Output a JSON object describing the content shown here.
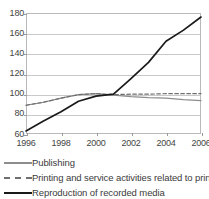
{
  "chart_data": {
    "type": "line",
    "title": "",
    "xlabel": "",
    "ylabel": "",
    "xlim": [
      1996,
      2006
    ],
    "ylim": [
      60,
      180
    ],
    "grid": true,
    "legend_position": "bottom-left",
    "ytick_labels": [
      "180",
      "160",
      "140",
      "120",
      "100",
      "80",
      "60"
    ],
    "yticks": [
      180,
      160,
      140,
      120,
      100,
      80,
      60
    ],
    "xtick_labels": [
      "1996",
      "1998",
      "2000",
      "2002",
      "2004",
      "2006"
    ],
    "xticks": [
      1996,
      1998,
      2000,
      2002,
      2004,
      2006
    ],
    "x": [
      1996,
      1997,
      1998,
      1999,
      2000,
      2001,
      2002,
      2003,
      2004,
      2005,
      2006
    ],
    "series": [
      {
        "name": "Publishing",
        "style": "solid",
        "color": "#8d8d8d",
        "values": [
          88.5,
          91.5,
          95.5,
          99.0,
          100.0,
          98.5,
          97.0,
          96.0,
          95.5,
          94.0,
          93.0
        ]
      },
      {
        "name": "Printing and service activities related to printing",
        "style": "dashed",
        "color": "#6f6f6f",
        "values": [
          88.5,
          91.5,
          95.5,
          99.0,
          100.0,
          99.0,
          99.5,
          99.5,
          100.0,
          100.0,
          100.0
        ]
      },
      {
        "name": "Reproduction of recorded media",
        "style": "solid",
        "color": "#1a1a1a",
        "values": [
          63.0,
          73.0,
          82.0,
          92.5,
          97.5,
          99.5,
          115.0,
          131.0,
          152.0,
          163.0,
          176.0
        ]
      }
    ]
  },
  "legend": {
    "items": [
      {
        "label": "Publishing"
      },
      {
        "label": "Printing and service activities related to printing"
      },
      {
        "label": "Reproduction of recorded media"
      }
    ]
  }
}
